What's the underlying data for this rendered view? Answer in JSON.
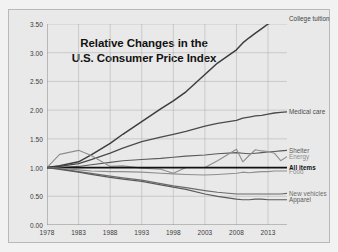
{
  "chart_data": {
    "type": "line",
    "title": "Relative Changes in the\nU.S. Consumer Price Index",
    "title_line1": "Relative Changes in the",
    "title_line2": "U.S. Consumer Price Index",
    "xlabel": "",
    "ylabel": "",
    "xlim": [
      1978,
      2016
    ],
    "ylim": [
      0.0,
      3.5
    ],
    "grid": true,
    "legend_position": "right-inline-labels",
    "xticks": [
      "1978",
      "1983",
      "1988",
      "1993",
      "1998",
      "2003",
      "2008",
      "2013"
    ],
    "xtick_values": [
      1978,
      1983,
      1988,
      1993,
      1998,
      2003,
      2008,
      2013
    ],
    "yticks": [
      "0.00",
      "0.50",
      "1.00",
      "1.50",
      "2.00",
      "2.50",
      "3.00",
      "3.50"
    ],
    "ytick_values": [
      0.0,
      0.5,
      1.0,
      1.5,
      2.0,
      2.5,
      3.0,
      3.5
    ],
    "x": [
      1978,
      1980,
      1983,
      1985,
      1988,
      1990,
      1993,
      1996,
      1998,
      2000,
      2003,
      2005,
      2008,
      2009,
      2010,
      2011,
      2012,
      2013,
      2014,
      2015,
      2016
    ],
    "series": [
      {
        "name": "College tuition",
        "color": "#3d3d3d",
        "width": 1.5,
        "label_x": 2016,
        "label_y": 3.6,
        "values": [
          1.0,
          1.03,
          1.1,
          1.22,
          1.42,
          1.58,
          1.8,
          2.02,
          2.16,
          2.32,
          2.62,
          2.82,
          3.05,
          3.17,
          3.26,
          3.34,
          3.42,
          3.5,
          3.56,
          3.6,
          3.62
        ]
      },
      {
        "name": "Medical care",
        "color": "#4a4a4a",
        "width": 1.3,
        "label_x": 2016,
        "label_y": 1.97,
        "values": [
          1.0,
          1.02,
          1.07,
          1.14,
          1.25,
          1.34,
          1.45,
          1.53,
          1.58,
          1.63,
          1.72,
          1.77,
          1.82,
          1.86,
          1.88,
          1.9,
          1.91,
          1.93,
          1.95,
          1.96,
          1.97
        ]
      },
      {
        "name": "Shelter",
        "color": "#5a5a5a",
        "width": 1.1,
        "label_x": 2016,
        "label_y": 1.3,
        "values": [
          1.0,
          1.0,
          1.02,
          1.05,
          1.09,
          1.12,
          1.14,
          1.16,
          1.18,
          1.2,
          1.22,
          1.24,
          1.26,
          1.25,
          1.24,
          1.25,
          1.26,
          1.27,
          1.28,
          1.29,
          1.3
        ]
      },
      {
        "name": "Energy",
        "color": "#8e8e8e",
        "width": 1.1,
        "label_x": 2016,
        "label_y": 1.19,
        "values": [
          1.0,
          1.23,
          1.3,
          1.21,
          1.02,
          1.03,
          0.99,
          0.97,
          0.9,
          1.0,
          1.0,
          1.12,
          1.32,
          1.1,
          1.21,
          1.31,
          1.29,
          1.28,
          1.25,
          1.12,
          1.19
        ]
      },
      {
        "name": "All items",
        "color": "#111111",
        "width": 1.7,
        "bold_label": true,
        "label_x": 2016,
        "label_y": 1.0,
        "values": [
          1.0,
          1.0,
          1.0,
          1.0,
          1.0,
          1.0,
          1.0,
          1.0,
          1.0,
          1.0,
          1.0,
          1.0,
          1.0,
          1.0,
          1.0,
          1.0,
          1.0,
          1.0,
          1.0,
          1.0,
          1.0
        ]
      },
      {
        "name": "Food",
        "color": "#8e8e8e",
        "width": 1.1,
        "label_x": 2016,
        "label_y": 0.94,
        "values": [
          1.0,
          0.99,
          0.96,
          0.94,
          0.93,
          0.93,
          0.92,
          0.9,
          0.89,
          0.88,
          0.87,
          0.88,
          0.9,
          0.92,
          0.91,
          0.92,
          0.93,
          0.93,
          0.94,
          0.94,
          0.94
        ]
      },
      {
        "name": "New vehicles",
        "color": "#6b6b6b",
        "width": 1.2,
        "label_x": 2016,
        "label_y": 0.55,
        "values": [
          1.0,
          0.98,
          0.93,
          0.9,
          0.85,
          0.82,
          0.78,
          0.72,
          0.68,
          0.65,
          0.6,
          0.57,
          0.54,
          0.54,
          0.54,
          0.54,
          0.54,
          0.54,
          0.54,
          0.54,
          0.55
        ]
      },
      {
        "name": "Apparel",
        "color": "#5a5a5a",
        "width": 1.2,
        "label_x": 2016,
        "label_y": 0.44,
        "values": [
          1.0,
          0.97,
          0.92,
          0.88,
          0.83,
          0.8,
          0.76,
          0.7,
          0.66,
          0.62,
          0.54,
          0.5,
          0.45,
          0.44,
          0.44,
          0.45,
          0.45,
          0.44,
          0.44,
          0.44,
          0.44
        ]
      }
    ]
  }
}
